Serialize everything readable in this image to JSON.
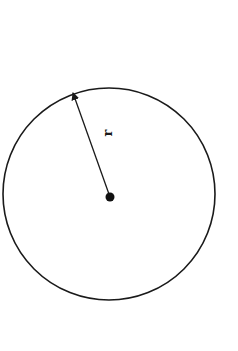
{
  "diagram": {
    "type": "circle-with-radius",
    "circle": {
      "cx": 109,
      "cy": 194,
      "r": 106,
      "stroke": "#1a1a1a",
      "stroke_width": 1.6
    },
    "center_point": {
      "cx": 110,
      "cy": 197,
      "r": 4.5,
      "fill": "#111111"
    },
    "radius_arrow": {
      "x1": 110,
      "y1": 197,
      "x2": 73,
      "y2": 92,
      "color": "#1a1a1a"
    },
    "radius_label": "r"
  }
}
